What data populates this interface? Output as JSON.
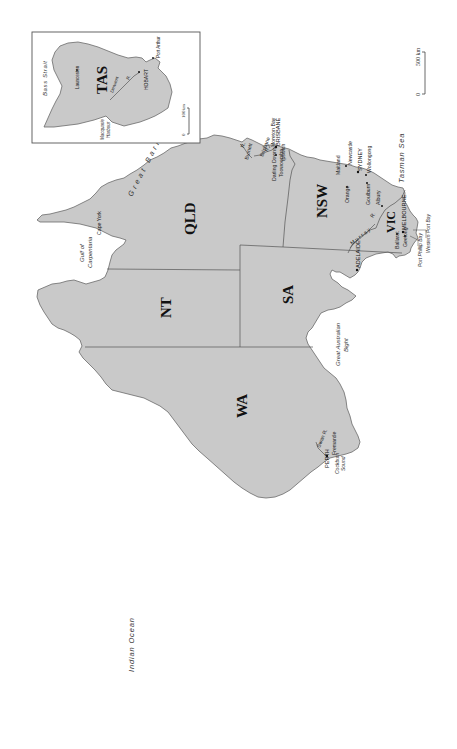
{
  "map": {
    "orientation": "rotated 90 degrees counter-clockwise",
    "colors": {
      "land": "#c9c9c9",
      "water": "#ffffff",
      "border": "#555555",
      "text": "#111111"
    },
    "states": {
      "wa": "WA",
      "nt": "NT",
      "sa": "SA",
      "qld": "QLD",
      "nsw": "NSW",
      "vic": "VIC",
      "tas": "TAS"
    },
    "water_bodies": {
      "indian_ocean": "Indian Ocean",
      "great_australian_bight_1": "Great Australian",
      "great_australian_bight_2": "Bight",
      "gulf_1": "Gulf of",
      "gulf_2": "Carpentaria",
      "tasman_sea": "Tasman Sea",
      "great_barrier_reef": "Great  Barrier  Reef",
      "bass_strait": "Bass Strait",
      "moreton_bay": "Moreton Bay",
      "port_phillip_bay": "Port Phillip Bay",
      "western_port_bay": "Western Port Bay",
      "cockburn_sound_1": "Cockburn",
      "cockburn_sound_2": "Sound",
      "macquarie_harbour_1": "Macquarie",
      "macquarie_harbour_2": "Harbour"
    },
    "places": {
      "perth": "PERTH",
      "fremantle": "Fremantle",
      "adelaide": "ADELAIDE",
      "melbourne": "MELBOURNE",
      "geelong": "Geelong",
      "ballarat": "Ballarat",
      "albury": "Albury",
      "goulburn": "Goulburn",
      "orange": "Orange",
      "wollongong": "Wollongong",
      "sydney": "SYDNEY",
      "newcastle": "Newcastle",
      "maitland": "Maitland",
      "brisbane": "BRISBANE",
      "ipswich": "Ipswich",
      "toowoomba": "Toowoomba",
      "darling_downs": "Darling Downs",
      "cape_york": "Cape York",
      "hobart": "HOBART",
      "launceston": "Launceston",
      "port_arthur": "Port Arthur"
    },
    "rivers": {
      "swan": "Swan R.",
      "murray_1": "Murray",
      "murray_2": "R.",
      "brisbane_1": "Brisbane",
      "brisbane_2": "R.",
      "burnett_1": "Burnett",
      "burnett_2": "R.",
      "derwent_1": "Derwent",
      "derwent_2": "R."
    },
    "scale_main": {
      "start": "0",
      "end": "500 km"
    },
    "scale_inset": {
      "start": "0",
      "end": "100km"
    }
  }
}
